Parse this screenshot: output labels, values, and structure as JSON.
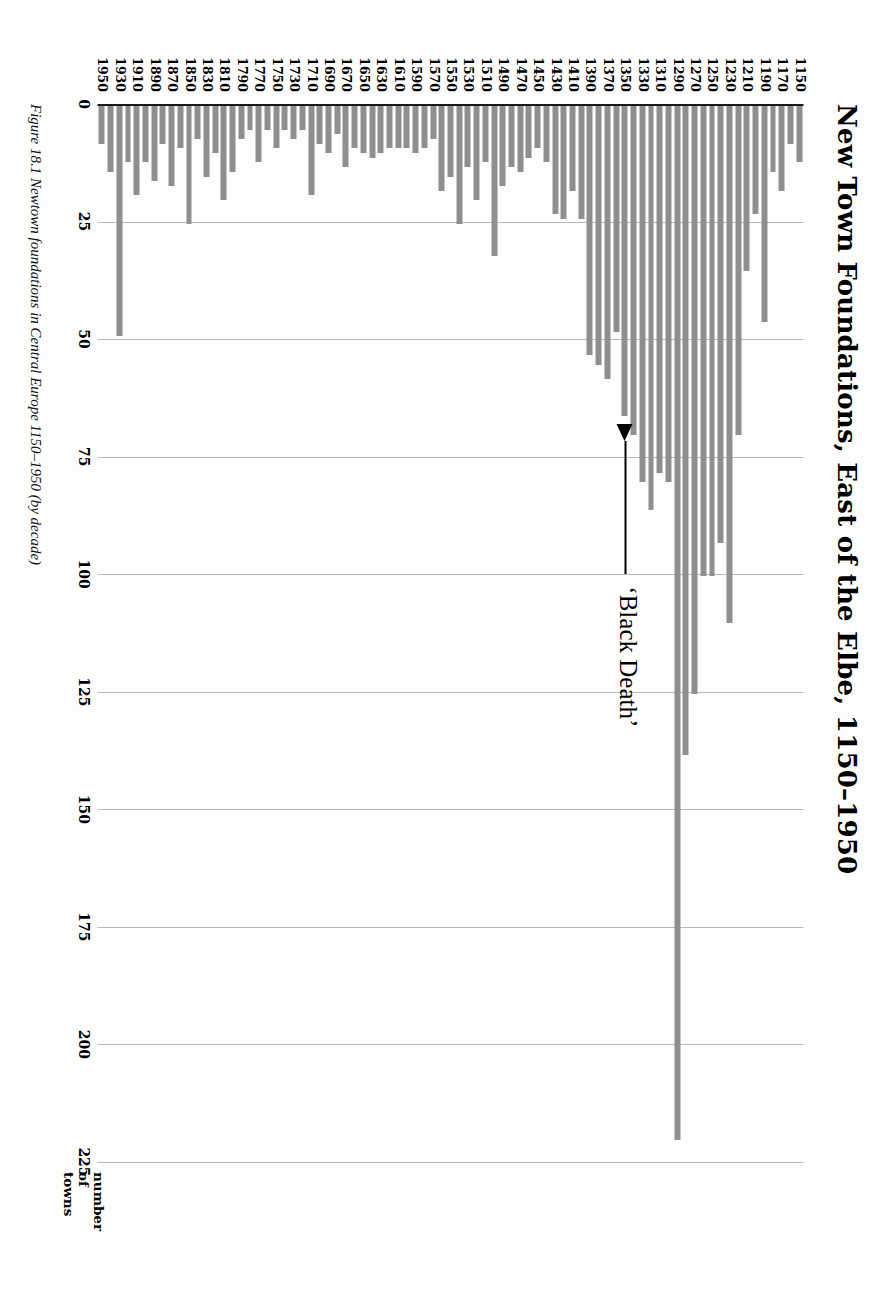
{
  "figure": {
    "title": "New Town Foundations, East of the Elbe, 1150–1950",
    "caption": "Figure 18.1  Newtown foundations in Central Europe 1150–1950 (by decade)",
    "axis_title": "number\nof\ntowns",
    "annotation_label": "‘Black Death’",
    "annotation_points_at": "1350",
    "bar_color": "#8f8f8f",
    "grid_color": "#b9b9b9",
    "axis_color": "#1a1a1a"
  },
  "chart_data": {
    "type": "bar",
    "orientation": "horizontal",
    "title": "New Town Foundations, East of the Elbe, 1150–1950",
    "xlabel": "number of towns",
    "ylabel": "",
    "xlim": [
      0,
      225
    ],
    "grid": true,
    "gridlines": [
      0,
      25,
      50,
      75,
      100,
      125,
      150,
      175,
      200,
      225
    ],
    "legend": null,
    "annotations": [
      {
        "text": "‘Black Death’",
        "target_category": "1350",
        "type": "arrow"
      }
    ],
    "tick_labels": [
      "0",
      "25",
      "50",
      "75",
      "100",
      "125",
      "150",
      "175",
      "200",
      "225"
    ],
    "categories": [
      "1150",
      "1160",
      "1170",
      "1180",
      "1190",
      "1200",
      "1210",
      "1220",
      "1230",
      "1240",
      "1250",
      "1260",
      "1270",
      "1280",
      "1290",
      "1300",
      "1310",
      "1320",
      "1330",
      "1340",
      "1350",
      "1360",
      "1370",
      "1380",
      "1390",
      "1400",
      "1410",
      "1420",
      "1430",
      "1440",
      "1450",
      "1460",
      "1470",
      "1480",
      "1490",
      "1500",
      "1510",
      "1520",
      "1530",
      "1540",
      "1550",
      "1560",
      "1570",
      "1580",
      "1590",
      "1600",
      "1610",
      "1620",
      "1630",
      "1640",
      "1650",
      "1660",
      "1670",
      "1680",
      "1690",
      "1700",
      "1710",
      "1720",
      "1730",
      "1740",
      "1750",
      "1760",
      "1770",
      "1780",
      "1790",
      "1800",
      "1810",
      "1820",
      "1830",
      "1840",
      "1850",
      "1860",
      "1870",
      "1880",
      "1890",
      "1900",
      "1910",
      "1920",
      "1930",
      "1940",
      "1950"
    ],
    "labelled_categories": [
      "1150",
      "1170",
      "1190",
      "1210",
      "1230",
      "1250",
      "1270",
      "1290",
      "1310",
      "1330",
      "1350",
      "1370",
      "1390",
      "1410",
      "1430",
      "1450",
      "1470",
      "1490",
      "1510",
      "1530",
      "1550",
      "1570",
      "1590",
      "1610",
      "1630",
      "1650",
      "1670",
      "1690",
      "1710",
      "1730",
      "1750",
      "1770",
      "1790",
      "1810",
      "1830",
      "1850",
      "1870",
      "1890",
      "1910",
      "1930",
      "1950"
    ],
    "values": [
      12,
      8,
      18,
      14,
      46,
      23,
      35,
      70,
      110,
      93,
      100,
      100,
      125,
      138,
      220,
      80,
      78,
      86,
      80,
      70,
      66,
      48,
      58,
      55,
      53,
      24,
      18,
      24,
      23,
      12,
      9,
      11,
      14,
      13,
      17,
      32,
      12,
      20,
      13,
      25,
      15,
      18,
      7,
      9,
      10,
      9,
      9,
      9,
      10,
      11,
      10,
      9,
      13,
      6,
      10,
      8,
      19,
      5,
      7,
      5,
      9,
      5,
      12,
      5,
      7,
      14,
      20,
      10,
      15,
      7,
      25,
      9,
      17,
      8,
      16,
      12,
      19,
      12,
      49,
      14,
      8
    ],
    "values_by_category": {
      "1150": 12,
      "1160": 8,
      "1170": 18,
      "1180": 14,
      "1190": 46,
      "1200": 23,
      "1210": 35,
      "1220": 70,
      "1230": 110,
      "1240": 93,
      "1250": 100,
      "1260": 100,
      "1270": 125,
      "1280": 138,
      "1290": 220,
      "1300": 80,
      "1310": 78,
      "1320": 86,
      "1330": 80,
      "1340": 70,
      "1350": 66,
      "1360": 48,
      "1370": 58,
      "1380": 55,
      "1390": 53,
      "1400": 24,
      "1410": 18,
      "1420": 24,
      "1430": 23,
      "1440": 12,
      "1450": 9,
      "1460": 11,
      "1470": 14,
      "1480": 13,
      "1490": 17,
      "1500": 32,
      "1510": 12,
      "1520": 20,
      "1530": 13,
      "1540": 25,
      "1550": 15,
      "1560": 18,
      "1570": 7,
      "1580": 9,
      "1590": 10,
      "1600": 9,
      "1610": 9,
      "1620": 9,
      "1630": 10,
      "1640": 11,
      "1650": 10,
      "1660": 9,
      "1670": 13,
      "1680": 6,
      "1690": 10,
      "1700": 8,
      "1710": 19,
      "1720": 5,
      "1730": 7,
      "1740": 5,
      "1750": 9,
      "1760": 5,
      "1770": 12,
      "1780": 5,
      "1790": 7,
      "1800": 14,
      "1810": 20,
      "1820": 10,
      "1830": 15,
      "1840": 7,
      "1850": 25,
      "1860": 9,
      "1870": 17,
      "1880": 8,
      "1890": 16,
      "1900": 12,
      "1910": 19,
      "1920": 12,
      "1930": 49,
      "1940": 14,
      "1950": 8
    }
  }
}
